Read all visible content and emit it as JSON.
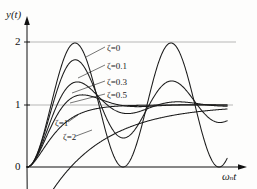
{
  "chart_data": {
    "type": "line",
    "title": "",
    "xlabel": "ωₙt",
    "ylabel": "y(t)",
    "xlim": [
      0,
      13.1
    ],
    "ylim": [
      0,
      2.15
    ],
    "xticks": [],
    "yticks": [
      0,
      1,
      2
    ],
    "ytick_labels": [
      "0",
      "1",
      "2"
    ],
    "grid": "horizontal gridlines at y=1 and y=2",
    "legend_position": "inline annotations with leader lines",
    "series": [
      {
        "name": "ζ=0",
        "zeta": 0,
        "label": "ζ=0",
        "peak_value": 2.0,
        "x": [
          0,
          1.571,
          3.142,
          4.712,
          6.283,
          7.854,
          9.425,
          10.996,
          12.566
        ],
        "values": [
          0,
          1.0,
          2.0,
          1.0,
          0.0,
          1.0,
          2.0,
          1.0,
          0.0
        ]
      },
      {
        "name": "ζ=0.1",
        "zeta": 0.1,
        "label": "ζ=0.1",
        "peak_value": 1.729,
        "x": [
          0,
          1.563,
          3.157,
          4.71,
          6.315,
          7.868,
          9.472,
          11.026,
          12.63
        ],
        "values": [
          0,
          1.146,
          1.729,
          1.039,
          0.533,
          0.922,
          1.39,
          1.021,
          0.75
        ]
      },
      {
        "name": "ζ=0.3",
        "zeta": 0.3,
        "label": "ζ=0.3",
        "peak_value": 1.372,
        "x": [
          0,
          1.571,
          3.294,
          4.865,
          6.588,
          8.159,
          9.882,
          11.453,
          13.176
        ],
        "values": [
          0,
          1.258,
          1.372,
          1.06,
          0.847,
          0.972,
          1.057,
          1.011,
          0.982
        ]
      },
      {
        "name": "ζ=0.5",
        "zeta": 0.5,
        "label": "ζ=0.5",
        "peak_value": 1.163,
        "x": [
          0,
          1.814,
          3.628,
          5.441,
          7.255,
          9.069,
          10.883,
          12.697
        ],
        "values": [
          0,
          1.21,
          1.163,
          0.975,
          0.991,
          1.002,
          1.0,
          1.0
        ]
      },
      {
        "name": "ζ=1",
        "zeta": 1,
        "label": "ζ=1",
        "peak_value": 1.0,
        "x": [
          0,
          1,
          2,
          3,
          4,
          5,
          6,
          8,
          10,
          13.1
        ],
        "values": [
          0,
          0.264,
          0.594,
          0.801,
          0.908,
          0.96,
          0.983,
          0.997,
          1.0,
          1.0
        ]
      },
      {
        "name": "ζ=2",
        "zeta": 2,
        "label": "ζ=2",
        "peak_value": 1.0,
        "x": [
          0,
          1,
          2,
          3,
          4,
          5,
          6,
          8,
          10,
          13.1
        ],
        "values": [
          0,
          0.035,
          0.125,
          0.248,
          0.375,
          0.489,
          0.584,
          0.724,
          0.822,
          0.912
        ]
      }
    ],
    "annotations": [
      {
        "text": "ζ=0",
        "x_px": 107,
        "y_px": 48
      },
      {
        "text": "ζ=0.1",
        "x_px": 107,
        "y_px": 66
      },
      {
        "text": "ζ=0.3",
        "x_px": 107,
        "y_px": 82
      },
      {
        "text": "ζ=0.5",
        "x_px": 107,
        "y_px": 95
      },
      {
        "text": "ζ=1",
        "x_px": 62,
        "y_px": 124
      },
      {
        "text": "ζ=2",
        "x_px": 70,
        "y_px": 138
      }
    ]
  },
  "colors": {
    "curve": "#1a1a1a",
    "grid": "#9a9a9a",
    "axis": "#111111",
    "background": "#fdfdfc"
  },
  "axes": {
    "y_label": "y(t)",
    "x_label_omega": "ω",
    "x_label_sub": "n",
    "x_label_t": "t",
    "ticks": {
      "zero": "0",
      "one": "1",
      "two": "2"
    }
  },
  "annotation_labels": {
    "z0": "ζ=0",
    "z01": "ζ=0.1",
    "z03": "ζ=0.3",
    "z05": "ζ=0.5",
    "z1": "ζ=1",
    "z2": "ζ=2"
  }
}
